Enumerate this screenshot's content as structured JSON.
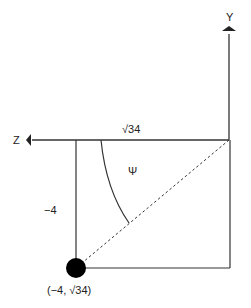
{
  "diagram": {
    "axes": {
      "y_label": "Y",
      "z_label": "Z"
    },
    "labels": {
      "top_length": "√34",
      "side_length": "−4",
      "angle": "Ψ",
      "point": "(−4, √34)"
    },
    "point": {
      "z": "−4",
      "y": "√34"
    },
    "colors": {
      "stroke": "#333333",
      "point": "#000000"
    }
  }
}
